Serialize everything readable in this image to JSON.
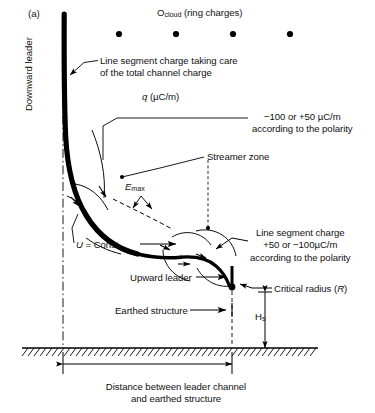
{
  "figure": {
    "panel_letter": "(a)",
    "axis_labels": {
      "downward_leader": "Downward leader"
    },
    "annotations": {
      "ocloud": "O",
      "ocloud_sub": "cloud",
      "ocloud_rest": " (ring charges)",
      "line_segment_top_l1": "Line segment charge taking care",
      "line_segment_top_l2": "of the total channel charge",
      "q_symbol": "q",
      "q_units": " (µC/m)",
      "polarity_top_l1": "−100 or +50 µC/m",
      "polarity_top_l2": "according to the polarity",
      "streamer_zone": "Streamer zone",
      "emax_symbol": "E",
      "emax_sub": "max",
      "u_symbol": "U",
      "u_rest": " = Const",
      "line_segment_right_l1": "Line segment charge",
      "line_segment_right_l2": "+50 or −100µC/m",
      "line_segment_right_l3": "according to the polarity",
      "upward_leader": "Upward leader",
      "critical_radius_pre": "Critical radius (",
      "critical_radius_sym": "R",
      "critical_radius_post": ")",
      "earthed_structure": "Earthed structure",
      "height_symbol": "H",
      "height_sub": "s",
      "caption_l1": "Distance between leader channel",
      "caption_l2": "and earthed structure"
    },
    "colors": {
      "ink": "#111111",
      "stroke": "#000000",
      "background": "#ffffff"
    },
    "geometry": {
      "ring_charge_dots_x": [
        119,
        176,
        233,
        290
      ],
      "ring_charge_dots_y": 34,
      "ring_charge_radius": 3.1,
      "leader_channel_x": 63,
      "ground_y": 348,
      "ground_x_start": 22,
      "ground_x_end": 318,
      "upward_leader_x": 232,
      "upward_leader_tip_y": 287,
      "dimension_y": 364,
      "dimension_x_start": 63,
      "dimension_x_end": 232
    }
  }
}
